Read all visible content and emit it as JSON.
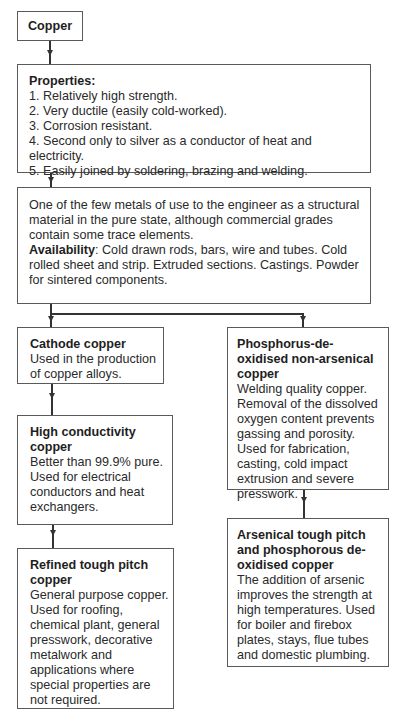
{
  "diagram": {
    "root": {
      "title": "Copper"
    },
    "properties": {
      "heading": "Properties:",
      "items": [
        "1.  Relatively high strength.",
        "2.  Very ductile (easily cold-worked).",
        "3.  Corrosion resistant.",
        "4.  Second only to silver as a conductor of heat and electricity.",
        "5.  Easily joined by soldering, brazing and welding."
      ]
    },
    "description": {
      "text": "One of the few metals of use to the engineer as a structural material in the pure state, although commercial grades contain some trace elements.",
      "availability_label": "Availability",
      "availability_text": ": Cold drawn rods, bars, wire and tubes. Cold rolled sheet and strip. Extruded sections. Castings. Powder for sintered components."
    },
    "left_branch": [
      {
        "title": "Cathode copper",
        "text": "Used in the production of copper alloys."
      },
      {
        "title": "High conductivity copper",
        "text": "Better than 99.9% pure. Used for electrical conductors and heat exchangers."
      },
      {
        "title": "Refined tough pitch copper",
        "text": "General purpose copper. Used for roofing, chemical plant, general presswork, decorative metalwork and applications where special properties are not required."
      }
    ],
    "right_branch": [
      {
        "title": "Phosphorus-de-oxidised non-arsenical copper",
        "text": "Welding quality copper. Removal of the dissolved oxygen content prevents gassing and porosity. Used for fabrication, casting, cold impact extrusion and severe presswork."
      },
      {
        "title": "Arsenical tough pitch and phosphorous de-oxidised copper",
        "text": "The addition of arsenic improves the strength at high temperatures. Used for boiler and firebox plates, stays, flue tubes and domestic plumbing."
      }
    ]
  }
}
